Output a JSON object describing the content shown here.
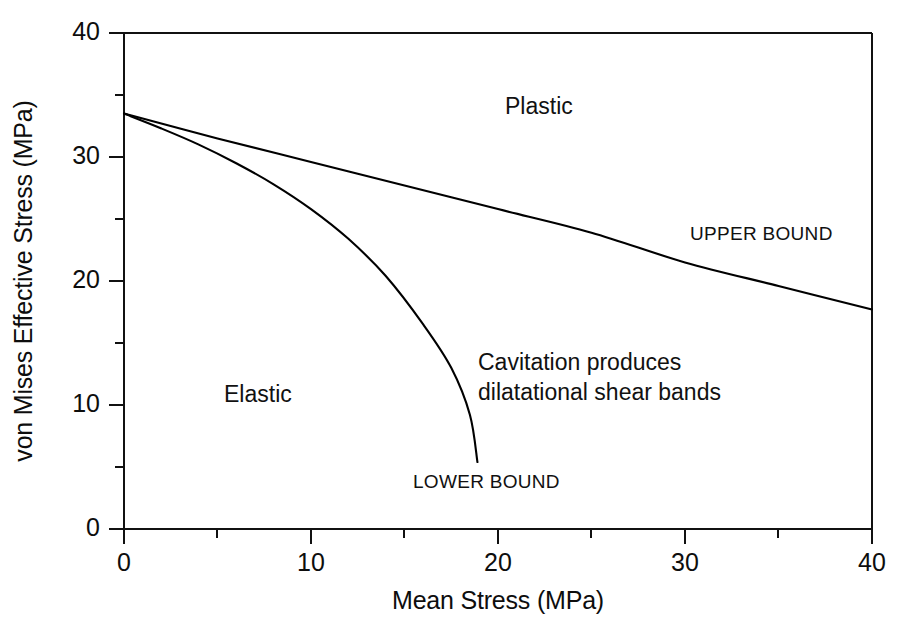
{
  "chart_data": {
    "type": "line",
    "title": "",
    "xlabel": "Mean Stress (MPa)",
    "ylabel": "von Mises Effective Stress (MPa)",
    "xlim": [
      0,
      40
    ],
    "ylim": [
      0,
      40
    ],
    "grid": false,
    "legend_position": "inline-annotations",
    "xticks": [
      0,
      10,
      20,
      30,
      40
    ],
    "xtick_labels": [
      "0",
      "10",
      "20",
      "30",
      "40"
    ],
    "x_minor_ticks": [
      5,
      15,
      25,
      35
    ],
    "yticks": [
      0,
      10,
      20,
      30,
      40
    ],
    "ytick_labels": [
      "0",
      "10",
      "20",
      "30",
      "40"
    ],
    "y_minor_ticks": [
      5,
      15,
      25,
      35
    ],
    "line_color": "#000000",
    "series": [
      {
        "name": "UPPER BOUND",
        "label": "UPPER BOUND",
        "x": [
          0,
          5,
          10,
          15,
          20,
          25,
          30,
          35,
          40
        ],
        "y": [
          33.5,
          31.5,
          29.6,
          27.7,
          25.8,
          23.9,
          21.5,
          19.6,
          17.7
        ]
      },
      {
        "name": "LOWER BOUND",
        "label": "LOWER BOUND",
        "x": [
          0,
          2,
          4,
          6,
          8,
          10,
          12,
          14,
          16,
          17.5,
          18.5,
          18.9
        ],
        "y": [
          33.5,
          32.3,
          31.0,
          29.5,
          27.8,
          25.8,
          23.4,
          20.4,
          16.5,
          13.0,
          9.2,
          5.4
        ]
      }
    ],
    "annotations": [
      {
        "text": "Plastic",
        "x": 30,
        "y": 35.5,
        "style": "region"
      },
      {
        "text": "Elastic",
        "x": 8.5,
        "y": 12.2,
        "style": "region"
      },
      {
        "text": "Cavitation produces",
        "x": 25.5,
        "y": 12.8,
        "style": "region"
      },
      {
        "text": "dilatational shear bands",
        "x": 25.5,
        "y": 10.5,
        "style": "region"
      },
      {
        "text": "UPPER BOUND",
        "x": 34.5,
        "y": 22.8,
        "style": "bound"
      },
      {
        "text": "LOWER BOUND",
        "x": 20.5,
        "y": 4.2,
        "style": "bound"
      }
    ]
  },
  "axes": {
    "ylabel": "von Mises Effective Stress (MPa)",
    "xlabel": "Mean Stress (MPa)",
    "ytick_labels": {
      "t40": "40",
      "t30": "30",
      "t20": "20",
      "t10": "10",
      "t0": "0"
    },
    "xtick_labels": {
      "t0": "0",
      "t10": "10",
      "t20": "20",
      "t30": "30",
      "t40": "40"
    }
  },
  "annotations": {
    "plastic": "Plastic",
    "elastic": "Elastic",
    "cavitation_line1": "Cavitation produces",
    "cavitation_line2": "dilatational shear bands",
    "upper_bound": "UPPER BOUND",
    "lower_bound": "LOWER BOUND"
  },
  "caption": {
    "partial_text": ""
  }
}
